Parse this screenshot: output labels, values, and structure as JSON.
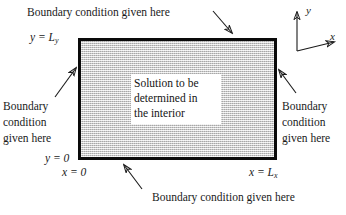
{
  "figure": {
    "type": "boundary-value-problem-diagram",
    "background_color": "#ffffff",
    "domain": {
      "fill_color": "#cccccc",
      "border_color": "#0a0a0a",
      "interior_text": "Solution to be\ndetermined in\nthe interior"
    },
    "captions": {
      "top": "Boundary condition given here",
      "left": "Boundary\ncondition\ngiven here",
      "right": "Boundary\ncondition\ngiven here",
      "bottom": "Boundary condition given here"
    },
    "axis_labels": {
      "y_top": "y = L",
      "y_top_sub": "y",
      "y_bottom": "y = 0",
      "x_left": "x = 0",
      "x_right": "x = L",
      "x_right_sub": "x"
    },
    "coordinate_axes": {
      "y_label": "y",
      "x_label": "x"
    },
    "interior_lines": [
      "Solution to be",
      "determined in",
      "the interior"
    ],
    "left_caption_lines": [
      "Boundary",
      "condition",
      "given here"
    ],
    "right_caption_lines": [
      "Boundary",
      "condition",
      "given here"
    ]
  }
}
